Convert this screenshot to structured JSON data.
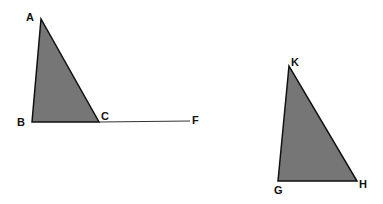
{
  "diagram": {
    "fill_color": "#767676",
    "stroke_color": "#111111",
    "triangles": [
      {
        "name": "ABC",
        "points": [
          [
            41,
            19
          ],
          [
            32,
            122
          ],
          [
            99,
            122
          ]
        ],
        "labels": [
          {
            "text": "A",
            "x": 26,
            "y": 21
          },
          {
            "text": "B",
            "x": 17,
            "y": 126
          },
          {
            "text": "C",
            "x": 101,
            "y": 120
          }
        ]
      },
      {
        "name": "KGH",
        "points": [
          [
            289,
            66
          ],
          [
            278,
            181
          ],
          [
            357,
            181
          ]
        ],
        "labels": [
          {
            "text": "K",
            "x": 291,
            "y": 66
          },
          {
            "text": "G",
            "x": 274,
            "y": 194
          },
          {
            "text": "H",
            "x": 359,
            "y": 188
          }
        ]
      }
    ],
    "segments": [
      {
        "name": "CF",
        "from": [
          99,
          122
        ],
        "to": [
          190,
          121
        ]
      }
    ],
    "extra_labels": [
      {
        "text": "F",
        "x": 192,
        "y": 124
      }
    ]
  }
}
